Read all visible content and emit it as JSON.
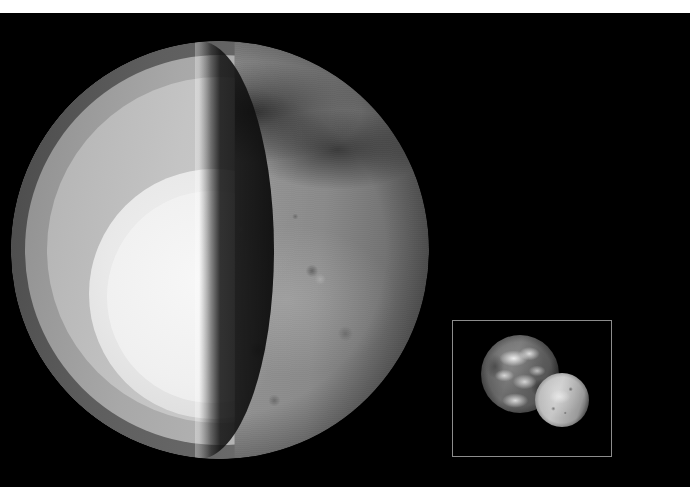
{
  "figure": {
    "medium": "grayscale scientific illustration",
    "background_color": "#000000",
    "letterbox_color": "#ffffff"
  },
  "canvas": {
    "width": 690,
    "height": 500,
    "top_band_height": 13,
    "bottom_band_height": 13
  },
  "main_planet": {
    "name": "Mars",
    "center_x": 220,
    "center_y": 250,
    "radius": 209,
    "description": "Large planetary globe, left half rendered as a cutaway revealing concentric interior layers, right half showing the cratered photographic surface.",
    "layers": [
      {
        "name": "crust",
        "label": "Crust",
        "color": "#5e5e5e",
        "order": 1
      },
      {
        "name": "upper-mantle",
        "label": "Upper mantle",
        "color": "#a8a8a8",
        "order": 2
      },
      {
        "name": "lower-mantle",
        "label": "Lower mantle",
        "color": "#c4c4c4",
        "order": 3
      },
      {
        "name": "outer-core",
        "label": "Outer core",
        "color": "#e4e4e4",
        "order": 4
      },
      {
        "name": "inner-core",
        "label": "Inner core",
        "color": "#f4f4f4",
        "order": 5
      }
    ],
    "cut_face": {
      "name": "cut-wall",
      "description": "Dark shadowed inner wall of the sliced hemisphere",
      "color": "#141414"
    },
    "surface": {
      "name": "planet-surface",
      "description": "Cratered terrain with dark albedo bands across the northern region and brighter southern plains",
      "base_color": "#9a9a9a",
      "dark_albedo_color": "#1e1e1e"
    }
  },
  "inset": {
    "name": "size-comparison-inset",
    "x": 452,
    "y": 320,
    "width": 160,
    "height": 137,
    "border_color": "#8c8c8c",
    "background_color": "#000000",
    "globes": [
      {
        "name": "earth-globe",
        "label": "Earth",
        "diameter_px": 78,
        "description": "Larger globe showing continents, oceans and cloud bands"
      },
      {
        "name": "mars-globe",
        "label": "Mars",
        "diameter_px": 54,
        "description": "Smaller bright globe overlapping the lower right of Earth"
      }
    ]
  }
}
